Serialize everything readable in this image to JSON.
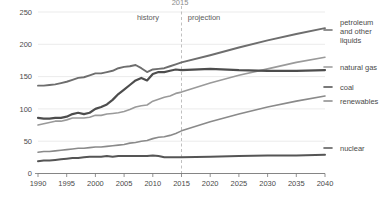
{
  "chart_data": {
    "type": "line",
    "title": "",
    "clipped_top_text": "2015",
    "xlabel": "",
    "ylabel": "",
    "xlim": [
      1990,
      2040
    ],
    "ylim": [
      0,
      250
    ],
    "x_ticks": [
      1990,
      1995,
      2000,
      2005,
      2010,
      2015,
      2020,
      2025,
      2030,
      2035,
      2040
    ],
    "y_ticks": [
      0,
      50,
      100,
      150,
      200,
      250
    ],
    "grid": true,
    "legend_position": "right-inline",
    "annotations": [
      {
        "text": "history",
        "x": 2008
      },
      {
        "text": "projection",
        "x": 2022
      }
    ],
    "divider_x": 2015,
    "x": [
      1990,
      1991,
      1992,
      1993,
      1994,
      1995,
      1996,
      1997,
      1998,
      1999,
      2000,
      2001,
      2002,
      2003,
      2004,
      2005,
      2006,
      2007,
      2008,
      2009,
      2010,
      2011,
      2012,
      2013,
      2014,
      2015,
      2020,
      2025,
      2030,
      2035,
      2040
    ],
    "series": [
      {
        "name": "petroleum and other liquids",
        "label": "petroleum\nand other\nliquids",
        "color": "#6e6e6e",
        "width": 1.9,
        "values": [
          136,
          136,
          137,
          138,
          140,
          142,
          145,
          148,
          149,
          152,
          155,
          155,
          157,
          159,
          163,
          165,
          166,
          168,
          163,
          157,
          161,
          162,
          163,
          166,
          169,
          172,
          183,
          195,
          206,
          216,
          225
        ]
      },
      {
        "name": "natural gas",
        "label": "natural gas",
        "color": "#9a9a9a",
        "width": 1.6,
        "values": [
          75,
          77,
          79,
          81,
          81,
          83,
          86,
          86,
          86,
          87,
          90,
          90,
          92,
          93,
          94,
          96,
          99,
          103,
          105,
          106,
          112,
          115,
          118,
          120,
          124,
          126,
          140,
          152,
          162,
          172,
          180
        ]
      },
      {
        "name": "coal",
        "label": "coal",
        "color": "#4d4d4d",
        "width": 2.2,
        "values": [
          86,
          85,
          85,
          86,
          86,
          88,
          92,
          94,
          92,
          94,
          100,
          103,
          107,
          114,
          123,
          130,
          137,
          144,
          148,
          144,
          154,
          157,
          157,
          159,
          161,
          160,
          162,
          160,
          159,
          159,
          160
        ]
      },
      {
        "name": "renewables",
        "label": "renewables",
        "color": "#8a8a8a",
        "width": 1.6,
        "values": [
          33,
          34,
          34,
          35,
          36,
          37,
          38,
          39,
          39,
          40,
          41,
          41,
          42,
          43,
          44,
          45,
          47,
          48,
          50,
          51,
          54,
          56,
          57,
          59,
          62,
          66,
          80,
          92,
          103,
          112,
          120
        ]
      },
      {
        "name": "nuclear",
        "label": "nuclear",
        "color": "#555555",
        "width": 2.0,
        "values": [
          19,
          20,
          20,
          21,
          22,
          23,
          24,
          24,
          25,
          26,
          26,
          26,
          27,
          26,
          27,
          27,
          27,
          27,
          27,
          27,
          28,
          27,
          25,
          25,
          25,
          25,
          26,
          27,
          28,
          28,
          29
        ]
      }
    ],
    "legend_entries": [
      {
        "name": "petroleum and other liquids",
        "lines": [
          "petroleum",
          "and other",
          "liquids"
        ],
        "color": "#6e6e6e"
      },
      {
        "name": "natural gas",
        "lines": [
          "natural gas"
        ],
        "color": "#9a9a9a"
      },
      {
        "name": "coal",
        "lines": [
          "coal"
        ],
        "color": "#4d4d4d"
      },
      {
        "name": "renewables",
        "lines": [
          "renewables"
        ],
        "color": "#8a8a8a"
      },
      {
        "name": "nuclear",
        "lines": [
          "nuclear"
        ],
        "color": "#555555"
      }
    ]
  },
  "axis": {
    "y_tick_labels": [
      "250",
      "200",
      "150",
      "100",
      "50",
      "0"
    ],
    "x_tick_labels": [
      "1990",
      "1995",
      "2000",
      "2005",
      "2010",
      "2015",
      "2020",
      "2025",
      "2030",
      "2035",
      "2040"
    ]
  },
  "annotations": {
    "history": "history",
    "projection": "projection",
    "clipped_top": "2015"
  },
  "legend": {
    "petroleum_line1": "petroleum",
    "petroleum_line2": "and other",
    "petroleum_line3": "liquids",
    "natural_gas": "natural gas",
    "coal": "coal",
    "renewables": "renewables",
    "nuclear": "nuclear"
  },
  "colors": {
    "petroleum": "#6e6e6e",
    "natural_gas": "#9a9a9a",
    "coal": "#4d4d4d",
    "renewables": "#8a8a8a",
    "nuclear": "#555555",
    "grid": "#e6e6e6",
    "axis": "#777777",
    "text": "#4a4a4a"
  }
}
